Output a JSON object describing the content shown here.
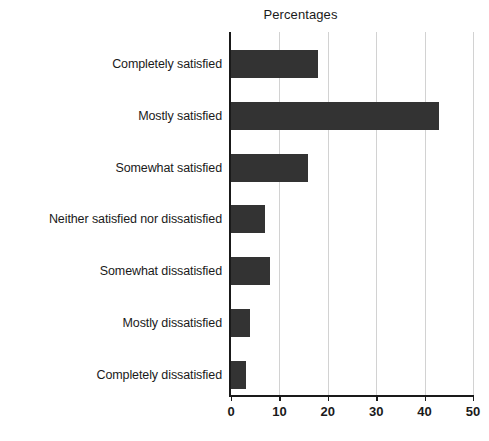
{
  "chart_data": {
    "type": "bar",
    "orientation": "horizontal",
    "title": "Percentages",
    "xlabel": "",
    "ylabel": "",
    "categories": [
      "Completely satisfied",
      "Mostly satisfied",
      "Somewhat satisfied",
      "Neither satisfied nor dissatisfied",
      "Somewhat dissatisfied",
      "Mostly dissatisfied",
      "Completely dissatisfied"
    ],
    "values": [
      18,
      43,
      16,
      7,
      8,
      4,
      3
    ],
    "xlim": [
      0,
      50
    ],
    "xticks": [
      0,
      10,
      20,
      30,
      40,
      50
    ],
    "xtick_labels": [
      "0",
      "10",
      "20",
      "30",
      "40",
      "50"
    ],
    "grid": "vertical",
    "legend": "none",
    "bar_color": "#333333",
    "gridline_color": "#d2d2d2",
    "axis_color": "#1a1a1a",
    "background_color": "#ffffff"
  }
}
